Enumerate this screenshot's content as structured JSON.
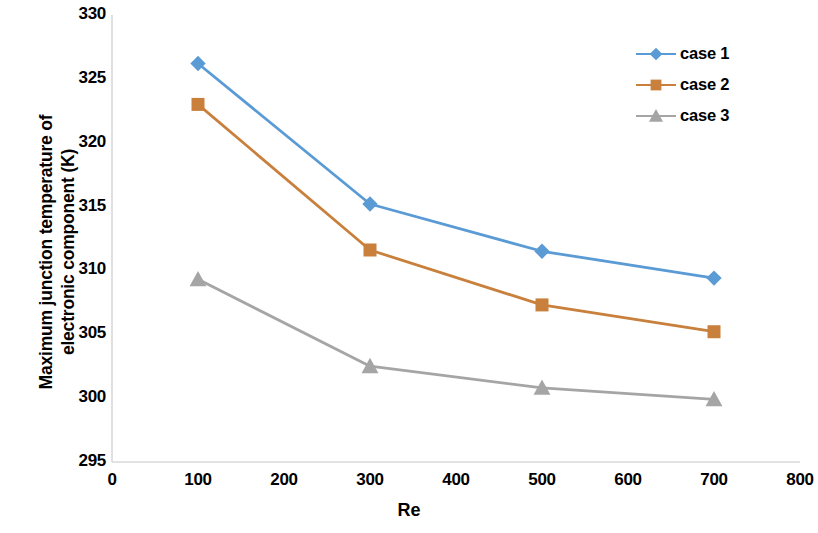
{
  "chart_data": {
    "type": "line",
    "title": "",
    "xlabel": "Re",
    "ylabel": "Maximum junction temperature of electronic component (K)",
    "ylabel_line1": "Maximum junction temperature of",
    "ylabel_line2": "electronic component (K)",
    "x": [
      100,
      300,
      500,
      700
    ],
    "xlim": [
      0,
      800
    ],
    "ylim": [
      295,
      330
    ],
    "xticks": [
      0,
      100,
      200,
      300,
      400,
      500,
      600,
      700,
      800
    ],
    "yticks": [
      295,
      300,
      305,
      310,
      315,
      320,
      325,
      330
    ],
    "grid": false,
    "legend_position": "top-right",
    "series": [
      {
        "name": "case 1",
        "color": "#5B9BD5",
        "marker": "diamond",
        "values": [
          326.2,
          315.2,
          311.5,
          309.4
        ]
      },
      {
        "name": "case 2",
        "color": "#C8803C",
        "marker": "square",
        "values": [
          323.0,
          311.6,
          307.3,
          305.2
        ]
      },
      {
        "name": "case 3",
        "color": "#A5A5A5",
        "marker": "triangle",
        "values": [
          309.3,
          302.5,
          300.8,
          299.9
        ]
      }
    ]
  },
  "axis": {
    "y_tick_labels": [
      "330",
      "325",
      "320",
      "315",
      "310",
      "305",
      "300",
      "295"
    ],
    "x_tick_labels": [
      "0",
      "100",
      "200",
      "300",
      "400",
      "500",
      "600",
      "700",
      "800"
    ],
    "x_title": "Re",
    "y_title_line1": "Maximum junction temperature of",
    "y_title_line2": "electronic component (K)",
    "axis_line_color": "#D9D9D9"
  },
  "legend": {
    "items": [
      {
        "label": "case 1",
        "color": "#5B9BD5",
        "marker": "diamond"
      },
      {
        "label": "case 2",
        "color": "#C8803C",
        "marker": "square"
      },
      {
        "label": "case 3",
        "color": "#A5A5A5",
        "marker": "triangle"
      }
    ]
  }
}
